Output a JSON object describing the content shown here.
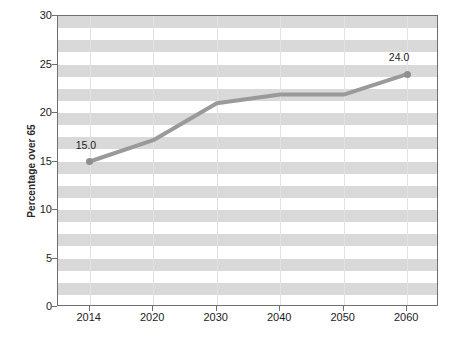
{
  "chart_data": {
    "type": "line",
    "title": "",
    "xlabel": "",
    "ylabel": "Percentage over 65",
    "categories": [
      "2014",
      "2020",
      "2030",
      "2040",
      "2050",
      "2060"
    ],
    "values": [
      15.0,
      17.2,
      21.0,
      21.9,
      21.9,
      24.0
    ],
    "series": [
      {
        "name": "Percentage over 65",
        "values": [
          15.0,
          17.2,
          21.0,
          21.9,
          21.9,
          24.0
        ]
      }
    ],
    "point_labels": [
      "15.0",
      "",
      "",
      "",
      "",
      "24.0"
    ],
    "ylim": [
      0,
      30
    ],
    "yticks": [
      0,
      5,
      10,
      15,
      20,
      25,
      30
    ],
    "ytick_labels": [
      "0",
      "5",
      "10",
      "15",
      "20",
      "25",
      "30"
    ],
    "xtick_labels": [
      "2014",
      "2020",
      "2030",
      "2040",
      "2050",
      "2060"
    ],
    "grid": {
      "horizontal_bands": true,
      "vertical_gridlines": true,
      "band_interval": 1.25
    },
    "legend": {
      "visible": false,
      "position": "none"
    },
    "colors": {
      "line": "#9a9a9a",
      "marker": "#8f8f8f",
      "band": "#d9d9d9",
      "background": "#ffffff",
      "axis": "#6f6f6f",
      "text": "#1c1c1c",
      "vertical_gridline": "#e2e2e2"
    }
  }
}
